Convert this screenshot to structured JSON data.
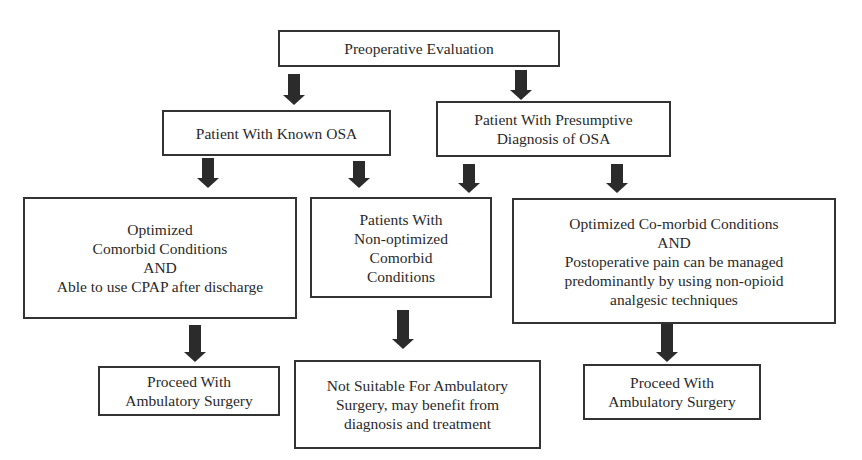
{
  "diagram": {
    "title_node": {
      "label": "Preoperative Evaluation"
    },
    "nodes": {
      "known_osa": {
        "label": "Patient With Known OSA"
      },
      "presumptive_osa": {
        "label": "Patient With Presumptive\nDiagnosis of OSA"
      },
      "optimized_cpap": {
        "label": "Optimized\nComorbid Conditions\nAND\nAble to use CPAP after discharge"
      },
      "non_optimized": {
        "label": "Patients With\nNon-optimized\nComorbid\nConditions"
      },
      "optimized_nonopioid": {
        "label": "Optimized Co-morbid Conditions\nAND\nPostoperative pain can be managed\npredominantly by using non-opioid\nanalgesic techniques"
      },
      "proceed_left": {
        "label": "Proceed With\nAmbulatory Surgery"
      },
      "not_suitable": {
        "label": "Not Suitable For Ambulatory\nSurgery, may benefit from\ndiagnosis and treatment"
      },
      "proceed_right": {
        "label": "Proceed With\nAmbulatory Surgery"
      }
    },
    "edges": [
      {
        "from": "title_node",
        "to": "known_osa"
      },
      {
        "from": "title_node",
        "to": "presumptive_osa"
      },
      {
        "from": "known_osa",
        "to": "optimized_cpap"
      },
      {
        "from": "known_osa",
        "to": "non_optimized"
      },
      {
        "from": "presumptive_osa",
        "to": "non_optimized"
      },
      {
        "from": "presumptive_osa",
        "to": "optimized_nonopioid"
      },
      {
        "from": "optimized_cpap",
        "to": "proceed_left"
      },
      {
        "from": "non_optimized",
        "to": "not_suitable"
      },
      {
        "from": "optimized_nonopioid",
        "to": "proceed_right"
      }
    ]
  }
}
